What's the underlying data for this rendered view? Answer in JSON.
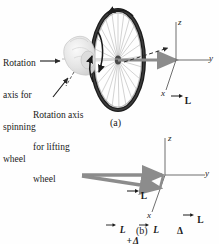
{
  "figure": {
    "panels": [
      {
        "id": "a",
        "label": "(a)",
        "annotations": [
          {
            "name": "rotation-axis-spinning",
            "lines": [
              "Rotation",
              "axis for",
              "spinning",
              "wheel"
            ],
            "text": "Rotation axis for spinning wheel"
          },
          {
            "name": "rotation-axis-lifting",
            "lines": [
              "Rotation axis",
              "for lifting",
              "wheel"
            ],
            "text": "Rotation axis for lifting wheel"
          }
        ],
        "axes": {
          "z": "z",
          "y": "y",
          "x": "x"
        },
        "vectors": [
          {
            "name": "L",
            "symbol": "L",
            "overline": "→"
          }
        ]
      },
      {
        "id": "b",
        "label": "(b)",
        "axes": {
          "z": "z",
          "y": "y",
          "x": "x"
        },
        "vectors": [
          {
            "name": "L",
            "symbol": "L"
          },
          {
            "name": "L-plus-delta-L",
            "symbol": "L + ΔL",
            "parts": [
              "L",
              "+",
              "Δ",
              "L"
            ]
          },
          {
            "name": "delta-L",
            "symbol": "ΔL",
            "parts": [
              "Δ",
              "L"
            ]
          }
        ]
      }
    ],
    "colors": {
      "vector_gray": "#8c8c8c",
      "vector_gray_dark": "#7a7a7a",
      "axis_gray": "#6e6e6e",
      "rim_dark": "#1c1c1c",
      "spoke_gray": "#9a9a9a",
      "hand_light": "#e2e2e2",
      "text": "#1a1a1a",
      "background": "#ffffff"
    }
  }
}
